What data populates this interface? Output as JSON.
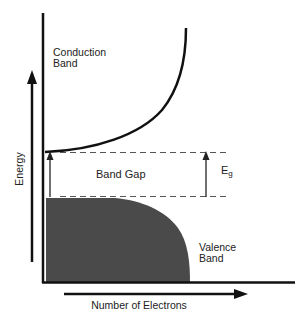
{
  "diagram": {
    "colors": {
      "line": "#111111",
      "valence_fill": "#4a4a4a",
      "dash": "#555555",
      "text": "#222222"
    },
    "labels": {
      "conduction_line1": "Conduction",
      "conduction_line2": "Band",
      "band_gap": "Band Gap",
      "eg_main": "E",
      "eg_sub": "g",
      "valence_line1": "Valence",
      "valence_line2": "Band",
      "y_axis": "Energy",
      "x_axis": "Number of Electrons"
    }
  }
}
